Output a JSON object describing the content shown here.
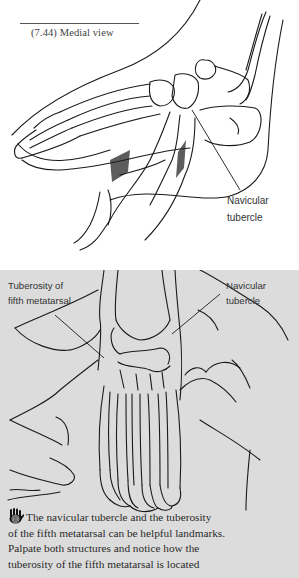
{
  "figure_top": {
    "caption": "(7.44) Medial view",
    "label_lines": [
      "Navicular",
      "tubercle"
    ]
  },
  "figure_bottom": {
    "left_label_lines": [
      "Tuberosity of",
      "fifth metatarsal"
    ],
    "right_label_lines": [
      "Navicular",
      "tubercle"
    ]
  },
  "body_text": {
    "icon": "palpation-hand-icon",
    "lines": [
      "The navicular tubercle and the tuberosity",
      "of the fifth metatarsal can be helpful landmarks.",
      "Palpate both structures and notice how the",
      "tuberosity of the fifth metatarsal is located"
    ]
  },
  "colors": {
    "page_white": "#ffffff",
    "figure_gray": "#dcdcdc",
    "ink": "#1a1a1a"
  }
}
